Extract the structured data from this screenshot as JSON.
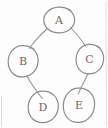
{
  "image": {
    "title": "hand-drawn graph sketch",
    "background_color": "#fdfdfd",
    "ink_color": "#8a8684",
    "width": 108,
    "height": 128
  },
  "graph_data": {
    "type": "node-link-diagram",
    "style": "hand-drawn pencil sketch",
    "nodes": [
      {
        "id": "A",
        "label": "A",
        "cx": 59,
        "cy": 20,
        "rx": 15,
        "ry": 13
      },
      {
        "id": "B",
        "label": "B",
        "cx": 23,
        "cy": 61,
        "rx": 15,
        "ry": 16
      },
      {
        "id": "C",
        "label": "C",
        "cx": 90,
        "cy": 59,
        "rx": 14,
        "ry": 15
      },
      {
        "id": "D",
        "label": "D",
        "cx": 43,
        "cy": 107,
        "rx": 15,
        "ry": 16
      },
      {
        "id": "E",
        "label": "E",
        "cx": 79,
        "cy": 105,
        "rx": 15,
        "ry": 17
      }
    ],
    "edges": [
      {
        "from": "A",
        "to": "B"
      },
      {
        "from": "A",
        "to": "C"
      },
      {
        "from": "B",
        "to": "D"
      },
      {
        "from": "C",
        "to": "E"
      }
    ],
    "node_count": 5,
    "edge_count": 4
  }
}
